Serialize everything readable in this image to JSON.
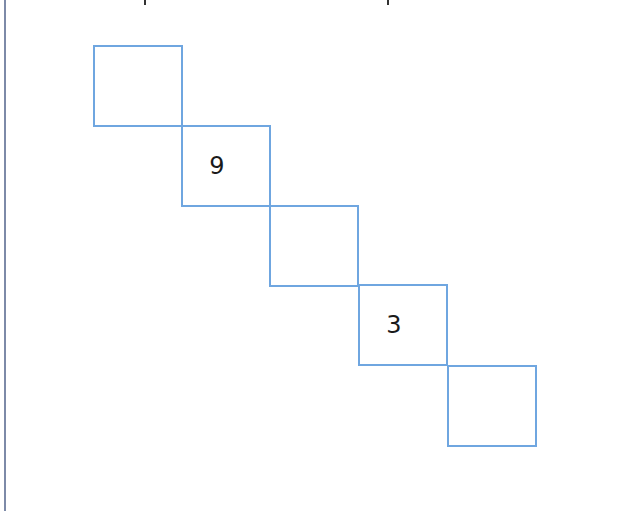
{
  "puzzle": {
    "line_color": "#6fa6e0",
    "border_color": "#7d8aa8",
    "cells": [
      {
        "index": 1,
        "value": ""
      },
      {
        "index": 2,
        "value": "9"
      },
      {
        "index": 3,
        "value": ""
      },
      {
        "index": 4,
        "value": "3"
      },
      {
        "index": 5,
        "value": ""
      }
    ]
  }
}
